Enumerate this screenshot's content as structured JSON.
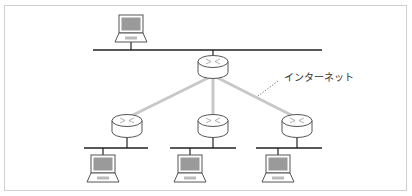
{
  "diagram": {
    "type": "network-topology",
    "label": {
      "text": "インターネット",
      "x": 284,
      "y": 81
    },
    "colors": {
      "frame": "#cfcfcf",
      "bus": "#222222",
      "link": "#c8c8c8",
      "device_outline": "#555555",
      "screen": "#9a9a9a",
      "leader": "#666666"
    },
    "top_network": {
      "bus": {
        "x1": 93,
        "x2": 322,
        "y": 50
      },
      "laptop": {
        "cx": 131,
        "top": 15
      }
    },
    "core_router": {
      "cx": 213,
      "cy": 70
    },
    "branches": [
      {
        "router": {
          "cx": 127,
          "cy": 129
        },
        "bus": {
          "x1": 84,
          "x2": 148,
          "y": 148
        },
        "laptop": {
          "cx": 103,
          "top": 155
        }
      },
      {
        "router": {
          "cx": 213,
          "cy": 129
        },
        "bus": {
          "x1": 170,
          "x2": 236,
          "y": 148
        },
        "laptop": {
          "cx": 190,
          "top": 155
        }
      },
      {
        "router": {
          "cx": 297,
          "cy": 129
        },
        "bus": {
          "x1": 256,
          "x2": 322,
          "y": 148
        },
        "laptop": {
          "cx": 278,
          "top": 155
        }
      }
    ]
  }
}
